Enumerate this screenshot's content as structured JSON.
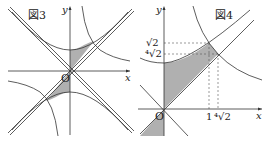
{
  "figures": [
    {
      "id": "fig3",
      "title": "図3",
      "x_axis_label": "x",
      "y_axis_label": "y",
      "origin_label": "O"
    },
    {
      "id": "fig4",
      "title": "図4",
      "x_axis_label": "x",
      "y_axis_label": "y",
      "origin_label": "O",
      "y_ticks": [
        "√2",
        "⁴√2"
      ],
      "x_ticks": [
        "1",
        "⁴√2"
      ]
    }
  ],
  "colors": {
    "line": "#333333",
    "shade": "#b0b0b0",
    "dash": "#555555"
  }
}
